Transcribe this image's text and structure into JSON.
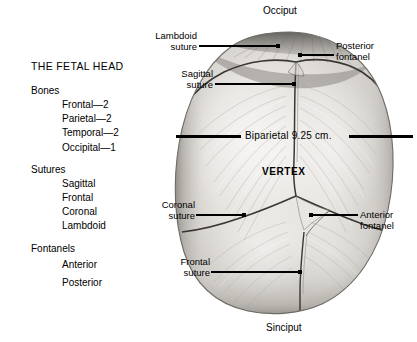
{
  "figure": {
    "title": "THE FETAL HEAD",
    "background_color": "#ffffff",
    "ink_color": "#101010"
  },
  "legend": {
    "title": "THE FETAL HEAD",
    "groups": [
      {
        "heading": "Bones",
        "items": [
          "Frontal—2",
          "Parietal—2",
          "Temporal—2",
          "Occipital—1"
        ]
      },
      {
        "heading": "Sutures",
        "items": [
          "Sagittal",
          "Frontal",
          "Coronal",
          "Lambdoid"
        ]
      },
      {
        "heading": "Fontanels",
        "items": [
          "Anterior",
          "Posterior"
        ]
      }
    ]
  },
  "diagram": {
    "poles": {
      "top": "Occiput",
      "bottom": "Sinciput",
      "center": "VERTEX"
    },
    "measurement": {
      "label": "Biparietal 9.25 cm.",
      "name": "Biparietal",
      "value": "9.25",
      "unit": "cm."
    },
    "callouts": [
      {
        "id": "lambdoid-suture",
        "line1": "Lambdoid",
        "line2": "suture",
        "side": "left"
      },
      {
        "id": "posterior-fontanel",
        "line1": "Posterior",
        "line2": "fontanel",
        "side": "right"
      },
      {
        "id": "sagittal-suture",
        "line1": "Sagittal",
        "line2": "suture",
        "side": "left"
      },
      {
        "id": "coronal-suture",
        "line1": "Coronal",
        "line2": "suture",
        "side": "left"
      },
      {
        "id": "anterior-fontanel",
        "line1": "Anterior",
        "line2": "fontanel",
        "side": "right"
      },
      {
        "id": "frontal-suture",
        "line1": "Frontal",
        "line2": "suture",
        "side": "left"
      }
    ]
  }
}
